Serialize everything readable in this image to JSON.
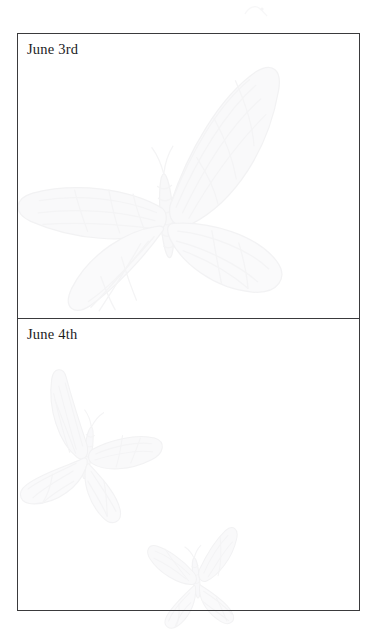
{
  "page": {
    "background_color": "#ffffff",
    "width": 377,
    "height": 636,
    "kind": "journal-page"
  },
  "journal": {
    "frame": {
      "border_color": "#3a3a3c",
      "border_width_px": 1.4
    },
    "entries": [
      {
        "label": "June 3rd",
        "body_text": "",
        "body_placeholder": ""
      },
      {
        "label": "June 4th",
        "body_text": "",
        "body_placeholder": ""
      }
    ]
  },
  "watermarks": {
    "color": "#f1f1f3",
    "stroke_color": "#ececed",
    "description": "butterfly illustrations",
    "items": [
      {
        "name": "butterfly-large-upper",
        "x": 14,
        "y": 56,
        "w": 300,
        "h": 300,
        "rotate": -4
      },
      {
        "name": "butterfly-medium-lower",
        "x": 16,
        "y": 372,
        "w": 160,
        "h": 160,
        "rotate": 8
      },
      {
        "name": "butterfly-small-bottom",
        "x": 140,
        "y": 520,
        "w": 112,
        "h": 112,
        "rotate": -6
      }
    ]
  },
  "marks": {
    "top_speck": "faint-ink-speck"
  }
}
